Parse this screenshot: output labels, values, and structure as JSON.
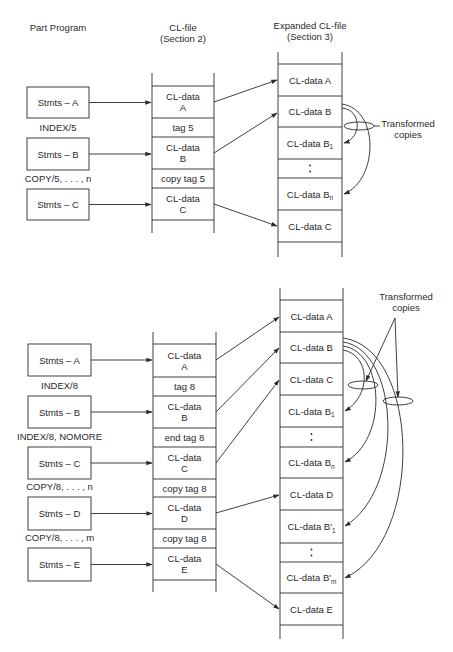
{
  "headers": {
    "part_program": "Part Program",
    "cl_file": [
      "CL-file",
      "(Section 2)"
    ],
    "expanded_cl_file": [
      "Expanded CL-file",
      "(Section 3)"
    ]
  },
  "annotation": {
    "transformed_copies": [
      "Transformed",
      "copies"
    ]
  },
  "diagrams": [
    {
      "name": "top",
      "part_program": {
        "x": 27,
        "w": 62,
        "boxes": [
          {
            "label": "Stmts – A",
            "y": 87,
            "h": 31
          },
          {
            "label": "Stmts – B",
            "y": 138,
            "h": 32
          },
          {
            "label": "Stmts – C",
            "y": 189,
            "h": 31
          }
        ],
        "directives": [
          {
            "text": "INDEX/5",
            "y": 131
          },
          {
            "text": "COPY/5, . . . , n",
            "y": 182
          }
        ]
      },
      "cl_file": {
        "x": 152,
        "w": 62,
        "top": 73,
        "bottom": 233,
        "rows": [
          {
            "lines": [
              "CL-data",
              "A"
            ],
            "y0": 86,
            "y1": 118
          },
          {
            "lines": [
              "tag 5"
            ],
            "y0": 118,
            "y1": 137
          },
          {
            "lines": [
              "CL-data",
              "B"
            ],
            "y0": 137,
            "y1": 169
          },
          {
            "lines": [
              "copy tag 5"
            ],
            "y0": 169,
            "y1": 188
          },
          {
            "lines": [
              "CL-data",
              "C"
            ],
            "y0": 188,
            "y1": 220
          }
        ]
      },
      "expanded": {
        "x": 278,
        "w": 64,
        "top": 52,
        "bottom": 257,
        "rows": [
          {
            "text": "CL-data A",
            "y0": 64,
            "y1": 96
          },
          {
            "text": "CL-data B",
            "y0": 96,
            "y1": 127
          },
          {
            "text": "CL-data B",
            "sub": "1",
            "y0": 127,
            "y1": 159
          },
          {
            "text": ":",
            "y0": 159,
            "y1": 178
          },
          {
            "text": "CL-data B",
            "sub": "n",
            "y0": 178,
            "y1": 210
          },
          {
            "text": "CL-data C",
            "y0": 210,
            "y1": 242
          }
        ]
      }
    },
    {
      "name": "bottom",
      "part_program": {
        "x": 28,
        "w": 63,
        "boxes": [
          {
            "label": "Stmts – A",
            "y": 344,
            "h": 32
          },
          {
            "label": "Stmts – B",
            "y": 396,
            "h": 32
          },
          {
            "label": "Stmts – C",
            "y": 447,
            "h": 32
          },
          {
            "label": "Stmts – D",
            "y": 497,
            "h": 33
          },
          {
            "label": "Stmts – E",
            "y": 548,
            "h": 33
          }
        ],
        "directives": [
          {
            "text": "INDEX/8",
            "y": 389
          },
          {
            "text": "INDEX/8, NOMORE",
            "y": 440
          },
          {
            "text": "COPY/8, . . . , n",
            "y": 490
          },
          {
            "text": "COPY/8, . . . , m",
            "y": 541
          }
        ]
      },
      "cl_file": {
        "x": 153,
        "w": 63,
        "top": 332,
        "bottom": 592,
        "rows": [
          {
            "lines": [
              "CL-data",
              "A"
            ],
            "y0": 344,
            "y1": 377
          },
          {
            "lines": [
              "tag 8"
            ],
            "y0": 377,
            "y1": 396
          },
          {
            "lines": [
              "CL-data",
              "B"
            ],
            "y0": 396,
            "y1": 428
          },
          {
            "lines": [
              "end tag 8"
            ],
            "y0": 428,
            "y1": 447
          },
          {
            "lines": [
              "CL-data",
              "C"
            ],
            "y0": 447,
            "y1": 479
          },
          {
            "lines": [
              "copy tag 8"
            ],
            "y0": 479,
            "y1": 497
          },
          {
            "lines": [
              "CL-data",
              "D"
            ],
            "y0": 497,
            "y1": 529
          },
          {
            "lines": [
              "copy tag 8"
            ],
            "y0": 529,
            "y1": 548
          },
          {
            "lines": [
              "CL-data",
              "E"
            ],
            "y0": 548,
            "y1": 580
          }
        ]
      },
      "expanded": {
        "x": 280,
        "w": 63,
        "top": 288,
        "bottom": 639,
        "rows": [
          {
            "text": "CL-data A",
            "y0": 300,
            "y1": 332
          },
          {
            "text": "CL-data B",
            "y0": 332,
            "y1": 363
          },
          {
            "text": "CL-data C",
            "y0": 363,
            "y1": 395
          },
          {
            "text": "CL-data B",
            "sub": "1",
            "y0": 395,
            "y1": 427
          },
          {
            "text": ":",
            "y0": 427,
            "y1": 447
          },
          {
            "text": "CL-data B",
            "sub": "n",
            "y0": 447,
            "y1": 478
          },
          {
            "text": "CL-data D",
            "y0": 478,
            "y1": 510
          },
          {
            "text": "CL-data B′",
            "sub": "1",
            "y0": 510,
            "y1": 543
          },
          {
            "text": ":",
            "y0": 543,
            "y1": 562
          },
          {
            "text": "CL-data B′",
            "sub": "m",
            "y0": 562,
            "y1": 593
          },
          {
            "text": "CL-data E",
            "y0": 593,
            "y1": 625
          }
        ]
      }
    }
  ],
  "colors": {
    "ink": "#2a2a2a",
    "background": "#ffffff"
  }
}
